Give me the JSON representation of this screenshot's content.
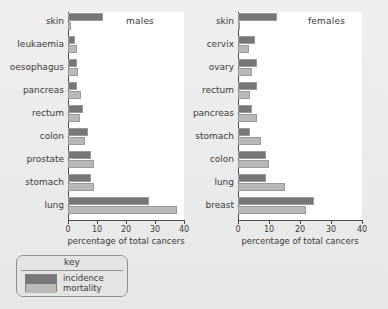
{
  "figure": {
    "background_color": "#ebebec",
    "incidence_color": "#77777a",
    "mortality_color": "#b9b9b7"
  },
  "legend": {
    "title": "key",
    "items": [
      {
        "label": "incidence",
        "color": "#77777a"
      },
      {
        "label": "mortality",
        "color": "#b9b9b7"
      }
    ]
  },
  "chart_data": [
    {
      "type": "bar",
      "title": "males",
      "orientation": "horizontal",
      "xlabel": "percentage of total cancers",
      "ylabel": "",
      "xlim": [
        0,
        40
      ],
      "xticks": [
        0,
        10,
        20,
        30,
        40
      ],
      "grid": false,
      "legend_position": "below-figure",
      "categories": [
        "skin",
        "leukaemia",
        "oesophagus",
        "pancreas",
        "rectum",
        "colon",
        "prostate",
        "stomach",
        "lung"
      ],
      "series": [
        {
          "name": "incidence",
          "values": [
            12,
            2.5,
            3,
            3,
            5,
            7,
            8,
            8,
            28
          ]
        },
        {
          "name": "mortality",
          "values": [
            1,
            3,
            3.5,
            4.5,
            4,
            6,
            9,
            9,
            37.5
          ]
        }
      ]
    },
    {
      "type": "bar",
      "title": "females",
      "orientation": "horizontal",
      "xlabel": "percentage of total cancers",
      "ylabel": "",
      "xlim": [
        0,
        40
      ],
      "xticks": [
        0,
        10,
        20,
        30,
        40
      ],
      "grid": false,
      "legend_position": "below-figure",
      "categories": [
        "skin",
        "cervix",
        "ovary",
        "rectum",
        "pancreas",
        "stomach",
        "colon",
        "lung",
        "breast"
      ],
      "series": [
        {
          "name": "incidence",
          "values": [
            12.5,
            5.5,
            6,
            6,
            4.5,
            4,
            9,
            9,
            24.5
          ]
        },
        {
          "name": "mortality",
          "values": [
            0.8,
            3.5,
            4.5,
            4,
            6,
            7.5,
            10,
            15,
            22
          ]
        }
      ]
    }
  ]
}
